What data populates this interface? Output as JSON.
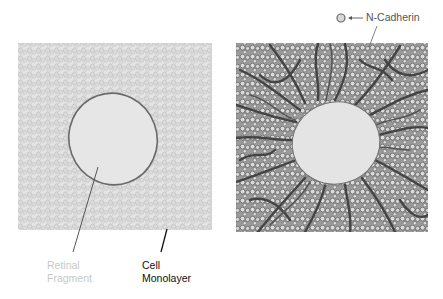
{
  "diagram": {
    "left_panel": {
      "name": "Cell monolayer with retinal fragment (control)",
      "fill": "#e2e2e2",
      "cell_outline": "#bdbdbd",
      "fragment_fill": "#e6e6e6",
      "fragment_outline": "#6a6a6a"
    },
    "right_panel": {
      "name": "Cell monolayer with N-Cadherin and neurite outgrowth",
      "fill": "#bdbdbd",
      "circle_fill": "#dcdcdc",
      "circle_outline": "#6a6a6a",
      "neurite_color": "#4a4a4a",
      "fragment_fill": "#e4e4e4"
    },
    "labels": {
      "retinal_line1": "Retinal",
      "retinal_line2": "Fragment",
      "cell_line1": "Cell",
      "cell_line2": "Monolayer",
      "legend": "N-Cadherin"
    },
    "legend": {
      "icon": "circle-icon",
      "arrow": "left-arrow-icon"
    }
  }
}
